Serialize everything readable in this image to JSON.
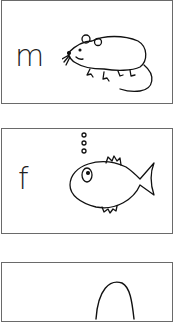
{
  "cards": [
    {
      "letter": "m",
      "picture": "mouse"
    },
    {
      "letter": "f",
      "picture": "fish"
    },
    {
      "letter": "",
      "picture": "partial-drawing"
    }
  ],
  "colors": {
    "line": "#111111",
    "border": "#6a6a6a",
    "background": "#ffffff"
  }
}
